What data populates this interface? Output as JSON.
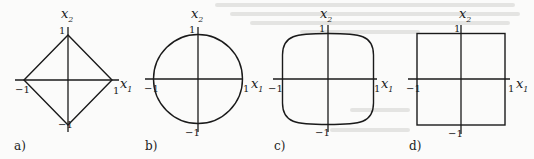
{
  "figure": {
    "panels": [
      {
        "id": "a",
        "label": "a)",
        "shape": "diamond",
        "norm": "L1",
        "axis_labels": {
          "x": "x",
          "x_sub": "1",
          "y": "x",
          "y_sub": "2"
        },
        "ticks": {
          "top": "1",
          "bottom": "−1",
          "left": "−1",
          "right": "1"
        }
      },
      {
        "id": "b",
        "label": "b)",
        "shape": "circle",
        "norm": "L2",
        "axis_labels": {
          "x": "x",
          "x_sub": "1",
          "y": "x",
          "y_sub": "2"
        },
        "ticks": {
          "top": "1",
          "bottom": "−1",
          "left": "−1",
          "right": "1"
        }
      },
      {
        "id": "c",
        "label": "c)",
        "shape": "superellipse",
        "norm": "Lp (p>2)",
        "axis_labels": {
          "x": "x",
          "x_sub": "1",
          "y": "x",
          "y_sub": "2"
        },
        "ticks": {
          "top": "1",
          "bottom": "−1",
          "left": "−1",
          "right": "1"
        }
      },
      {
        "id": "d",
        "label": "d)",
        "shape": "square",
        "norm": "Linf",
        "axis_labels": {
          "x": "x",
          "x_sub": "1",
          "y": "x",
          "y_sub": "2"
        },
        "ticks": {
          "top": "1",
          "bottom": "−1",
          "left": "−1",
          "right": "1"
        }
      }
    ],
    "colors": {
      "ink": "#1a1a1a",
      "paper": "#fbfbfa"
    }
  }
}
